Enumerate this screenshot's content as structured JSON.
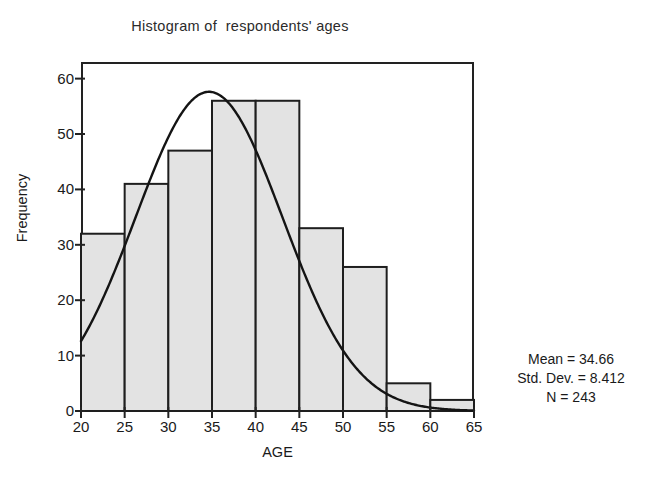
{
  "chart_data": {
    "type": "bar",
    "title": "Histogram of  respondents' ages",
    "xlabel": "AGE",
    "ylabel": "Frequency",
    "xlim": [
      20,
      65
    ],
    "ylim": [
      0,
      63
    ],
    "grid": false,
    "legend": "none",
    "bin_width": 5,
    "bin_edges": [
      20,
      25,
      30,
      35,
      40,
      45,
      50,
      55,
      60,
      65
    ],
    "categories": [
      "20-25",
      "25-30",
      "30-35",
      "35-40",
      "40-45",
      "45-50",
      "50-55",
      "55-60",
      "60-65"
    ],
    "values": [
      32,
      41,
      47,
      56,
      56,
      33,
      26,
      5,
      2
    ],
    "xticks": [
      20,
      25,
      30,
      35,
      40,
      45,
      50,
      55,
      60,
      65
    ],
    "xtick_labels": [
      "20",
      "25",
      "30",
      "35",
      "40",
      "45",
      "50",
      "55",
      "60",
      "65"
    ],
    "yticks": [
      0,
      10,
      20,
      30,
      40,
      50,
      60
    ],
    "ytick_labels": [
      "0",
      "10",
      "20",
      "30",
      "40",
      "50",
      "60"
    ],
    "overlay": {
      "name": "normal-curve",
      "type": "line",
      "mean": 34.66,
      "std_dev": 8.412,
      "n": 243,
      "peak_value": 57.6
    },
    "bar_fill_color": "#e3e3e3",
    "bar_edge_color": "#1e1e1e",
    "curve_color": "#141414",
    "axis_color": "#222222",
    "background_color": "#ffffff"
  },
  "annotations": {
    "mean_text": "Mean = 34.66",
    "std_dev_text": "Std. Dev. = 8.412",
    "n_text": "N = 243"
  }
}
